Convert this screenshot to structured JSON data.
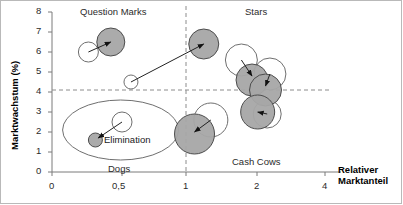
{
  "chart_data": {
    "type": "scatter",
    "title": "",
    "xlabel": "Relativer Marktanteil",
    "ylabel": "Marktwachstum (%)",
    "x_ticks": [
      "0",
      "0,5",
      "1",
      "2",
      "4"
    ],
    "x_tick_values": [
      0,
      0.5,
      1,
      2,
      4
    ],
    "x_scale": "log-like",
    "xlim": [
      0,
      4
    ],
    "y_ticks": [
      "0",
      "1",
      "2",
      "3",
      "4",
      "5",
      "6",
      "7",
      "8"
    ],
    "y_tick_values": [
      0,
      1,
      2,
      3,
      4,
      5,
      6,
      7,
      8
    ],
    "ylim": [
      0,
      8
    ],
    "grid": false,
    "legend": "none",
    "divider_x": 1,
    "divider_y": 4.1,
    "quadrant_labels": [
      {
        "key": "question_marks",
        "text": "Question Marks"
      },
      {
        "key": "stars",
        "text": "Stars"
      },
      {
        "key": "dogs",
        "text": "Dogs"
      },
      {
        "key": "cash_cows",
        "text": "Cash Cows"
      }
    ],
    "annotations": [
      {
        "key": "elimination",
        "text": "Elimination"
      }
    ],
    "bubbles": [
      {
        "id": "qm-current",
        "x": 0.42,
        "y": 6.5,
        "r": 14,
        "fill": "gray",
        "quadrant": "question_marks"
      },
      {
        "id": "qm-target",
        "x": 0.26,
        "y": 6.0,
        "r": 10,
        "fill": "white",
        "quadrant": "question_marks"
      },
      {
        "id": "qm-small",
        "x": 0.57,
        "y": 4.5,
        "r": 7,
        "fill": "white",
        "quadrant": "question_marks"
      },
      {
        "id": "star-1",
        "x": 1.25,
        "y": 6.4,
        "r": 15,
        "fill": "gray",
        "quadrant": "stars"
      },
      {
        "id": "star-2-out",
        "x": 1.78,
        "y": 5.6,
        "r": 16,
        "fill": "white",
        "quadrant": "stars"
      },
      {
        "id": "star-2",
        "x": 1.93,
        "y": 4.6,
        "r": 16,
        "fill": "gray",
        "quadrant": "stars"
      },
      {
        "id": "star-3-out",
        "x": 2.38,
        "y": 4.9,
        "r": 16,
        "fill": "white",
        "quadrant": "stars"
      },
      {
        "id": "star-3",
        "x": 2.25,
        "y": 4.1,
        "r": 16,
        "fill": "gray",
        "quadrant": "stars"
      },
      {
        "id": "cc-1-out",
        "x": 1.35,
        "y": 2.6,
        "r": 17,
        "fill": "white",
        "quadrant": "cash_cows"
      },
      {
        "id": "cc-1",
        "x": 1.12,
        "y": 1.9,
        "r": 20,
        "fill": "gray",
        "quadrant": "cash_cows"
      },
      {
        "id": "cc-2-out",
        "x": 2.3,
        "y": 2.9,
        "r": 14,
        "fill": "white",
        "quadrant": "cash_cows"
      },
      {
        "id": "cc-2",
        "x": 2.02,
        "y": 3.0,
        "r": 17,
        "fill": "gray",
        "quadrant": "cash_cows"
      },
      {
        "id": "dog-1",
        "x": 0.31,
        "y": 1.6,
        "r": 7,
        "fill": "gray",
        "quadrant": "dogs"
      },
      {
        "id": "dog-1-out",
        "x": 0.5,
        "y": 2.5,
        "r": 10,
        "fill": "white",
        "quadrant": "dogs"
      }
    ],
    "arrows": [
      {
        "id": "arrow-qm",
        "from": [
          0.26,
          6.0
        ],
        "to": [
          0.42,
          6.5
        ]
      },
      {
        "id": "arrow-long",
        "from": [
          0.57,
          4.5
        ],
        "to": [
          1.25,
          6.4
        ]
      },
      {
        "id": "arrow-star2",
        "from": [
          1.78,
          5.6
        ],
        "to": [
          1.93,
          4.8
        ]
      },
      {
        "id": "arrow-star3",
        "from": [
          2.38,
          4.9
        ],
        "to": [
          2.25,
          4.3
        ]
      },
      {
        "id": "arrow-cc1",
        "from": [
          1.35,
          2.6
        ],
        "to": [
          1.12,
          2.0
        ]
      },
      {
        "id": "arrow-cc2",
        "from": [
          2.3,
          2.9
        ],
        "to": [
          2.02,
          3.0
        ]
      },
      {
        "id": "arrow-dog",
        "from": [
          0.5,
          2.5
        ],
        "to": [
          0.33,
          1.7
        ]
      }
    ],
    "ellipses": [
      {
        "id": "dogs-ellipse",
        "cx": 0.49,
        "cy": 2.1,
        "rx": 58,
        "ry": 30
      }
    ],
    "colors": {
      "bubble_gray": "#a6a6a6",
      "bubble_stroke": "#4d4d4d",
      "axis": "#7a7a7a",
      "divider": "#8c8c8c",
      "text": "#1a1a1a",
      "frame": "#b9b9b9"
    }
  },
  "axis_titles": {
    "x_line1": "Relativer",
    "x_line2": "Marktanteil",
    "y": "Marktwachstum (%)"
  }
}
